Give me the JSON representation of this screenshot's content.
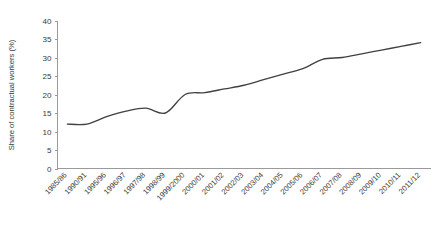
{
  "chart_data": {
    "type": "line",
    "title": "",
    "xlabel": "",
    "ylabel": "Share of contractual workers (%)",
    "ylim": [
      0,
      40
    ],
    "ytick_step": 5,
    "yticks": [
      "0",
      "5",
      "10",
      "15",
      "20",
      "25",
      "30",
      "35",
      "40"
    ],
    "grid": false,
    "legend": false,
    "legend_position": "none",
    "line_color": "#404040",
    "axis_color": "#9a9a9a",
    "background_color": "#ffffff",
    "xtick_rotation_degrees": -45,
    "smoothing": "spline",
    "categories": [
      "1985/86",
      "1990/91",
      "1995/96",
      "1996/97",
      "1997/98",
      "1998/99",
      "1999/2000",
      "2000/01",
      "2001/02",
      "2002/03",
      "2003/04",
      "2004/05",
      "2005/06",
      "2006/07",
      "2007/08",
      "2008/09",
      "2009/10",
      "2010/11",
      "2011/12"
    ],
    "series": [
      {
        "name": "Share of contractual workers",
        "values": [
          12,
          12,
          14,
          15.5,
          16.3,
          15,
          20,
          20.5,
          21.5,
          22.5,
          24,
          25.5,
          27,
          29.5,
          30,
          31,
          32,
          33,
          34
        ]
      }
    ]
  }
}
